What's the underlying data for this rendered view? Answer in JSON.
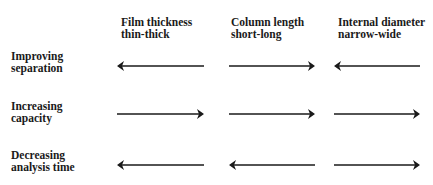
{
  "columns": [
    {
      "title": "Film thickness",
      "range": "thin-thick"
    },
    {
      "title": "Column length",
      "range": "short-long"
    },
    {
      "title": "Internal diameter",
      "range": "narrow-wide"
    }
  ],
  "rows": [
    {
      "line1": "Improving",
      "line2": "separation",
      "arrows": [
        "left",
        "right",
        "left"
      ]
    },
    {
      "line1": "Increasing",
      "line2": "capacity",
      "arrows": [
        "right",
        "right",
        "right"
      ]
    },
    {
      "line1": "Decreasing",
      "line2": "analysis time",
      "arrows": [
        "left",
        "left",
        "right"
      ]
    }
  ],
  "colors": {
    "text": "#1a1a1a",
    "arrow": "#1a1a1a",
    "background": "#ffffff"
  }
}
